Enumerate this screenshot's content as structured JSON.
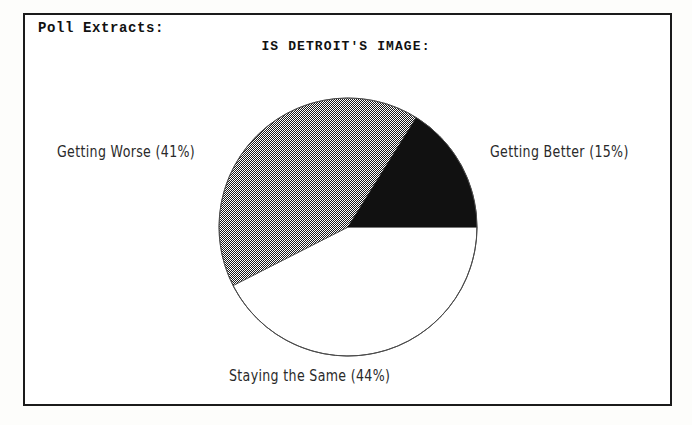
{
  "section": {
    "title": "Poll Extracts:"
  },
  "chart_data": {
    "type": "pie",
    "title": "IS DETROIT'S IMAGE:",
    "subtitle": "",
    "xlabel": "",
    "ylabel": "",
    "legend_position": "around-slices",
    "grid": false,
    "categories": [
      "Getting Better",
      "Staying the Same",
      "Getting Worse"
    ],
    "values": [
      15,
      44,
      41
    ],
    "unit": "%",
    "slices": [
      {
        "name": "getting-better",
        "label": "Getting Better  (15%)",
        "category": "Getting Better",
        "value": 15,
        "fill": "black",
        "color": "#111111",
        "start_angle_deg": 0,
        "end_angle_deg": 58,
        "label_position": "right"
      },
      {
        "name": "staying-the-same",
        "label": "Staying the Same  (44%)",
        "category": "Staying the Same",
        "value": 44,
        "fill": "white",
        "color": "#ffffff",
        "start_angle_deg": 207,
        "end_angle_deg": 360,
        "label_position": "bottom"
      },
      {
        "name": "getting-worse",
        "label": "Getting Worse  (41%)",
        "category": "Getting Worse",
        "value": 41,
        "fill": "dithered-gray",
        "color": "#8a8a8a",
        "start_angle_deg": 58,
        "end_angle_deg": 207,
        "label_position": "left"
      }
    ],
    "outline_color": "#4a4a4a",
    "center": {
      "x": 130,
      "y": 130
    },
    "radius": 129
  },
  "frame": {
    "border_color": "#1b1b1b",
    "background": "#ffffff"
  }
}
